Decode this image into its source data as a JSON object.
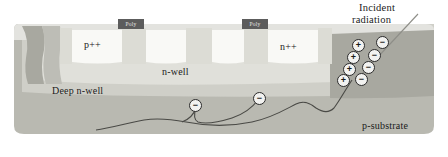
{
  "figure": {
    "type": "semiconductor-cross-section"
  },
  "labels": {
    "p_plus_plus": "p++",
    "n_plus_plus": "n++",
    "n_well": "n-well",
    "deep_n_well": "Deep n-well",
    "p_substrate": "p-substrate",
    "incident_line1": "Incident",
    "incident_line2": "radiation",
    "poly_left": "Poly",
    "poly_right": "Poly"
  },
  "colors": {
    "background": "#ffffff",
    "oxide_top": "#e3e3df",
    "diffusion_light": "#f7f7f3",
    "n_well": "#e0e0da",
    "deep_n_well": "#cfcfc8",
    "p_substrate": "#b9b9b1",
    "shield_dark": "#a8a8a0",
    "poly_fill": "#5c5c5c",
    "poly_text": "#e8e8e8",
    "charge_fill": "#f2f2f0",
    "charge_stroke": "#2b2b2b",
    "track_stroke": "#4a4a46",
    "text": "#1a1a1a"
  },
  "charges": [
    {
      "sign": "+",
      "x": 357,
      "y": 44
    },
    {
      "sign": "−",
      "x": 381,
      "y": 41
    },
    {
      "sign": "+",
      "x": 352,
      "y": 56
    },
    {
      "sign": "−",
      "x": 373,
      "y": 54
    },
    {
      "sign": "+",
      "x": 348,
      "y": 68
    },
    {
      "sign": "−",
      "x": 367,
      "y": 66
    },
    {
      "sign": "+",
      "x": 342,
      "y": 79
    },
    {
      "sign": "−",
      "x": 360,
      "y": 78
    }
  ],
  "track_electrons": [
    {
      "sign": "−",
      "x": 194,
      "y": 104
    },
    {
      "sign": "−",
      "x": 258,
      "y": 97
    }
  ]
}
